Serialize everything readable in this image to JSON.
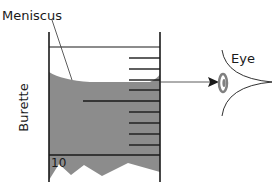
{
  "diagram": {
    "labels": {
      "meniscus": "Meniscus",
      "eye": "Eye",
      "burette": "Burette",
      "scale_value": "10"
    },
    "colors": {
      "liquid": "#8c8c8c",
      "lines": "#1a1a1a",
      "eye_iris": "#808080",
      "background": "#ffffff"
    }
  }
}
